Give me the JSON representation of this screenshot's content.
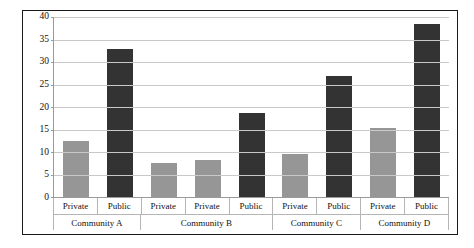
{
  "chart_data": {
    "type": "bar",
    "title": "",
    "xlabel": "",
    "ylabel": "",
    "ylim": [
      0,
      40
    ],
    "ytick_step": 5,
    "grid": true,
    "legend": "none",
    "ytick_labels": [
      "40",
      "35",
      "30",
      "25",
      "20",
      "15",
      "10",
      "5",
      "0"
    ],
    "categories": [
      "Private",
      "Public",
      "Private",
      "Private",
      "Public",
      "Private",
      "Public",
      "Private",
      "Public"
    ],
    "values": [
      12.4,
      32.8,
      7.5,
      8.2,
      18.6,
      9.5,
      26.9,
      15.3,
      38.4
    ],
    "bar_colors": [
      "#969696",
      "#333333",
      "#969696",
      "#969696",
      "#333333",
      "#969696",
      "#333333",
      "#969696",
      "#333333"
    ],
    "groups": [
      {
        "label": "Community A",
        "span": 2
      },
      {
        "label": "Community B",
        "span": 3
      },
      {
        "label": "Community C",
        "span": 2
      },
      {
        "label": "Community D",
        "span": 2
      }
    ],
    "colors": {
      "private_bar": "#969696",
      "public_bar": "#333333",
      "gridline": "#c9c9c9",
      "axis_line": "#9a9a9a",
      "frame_border": "#1a1a1a",
      "text": "#111111",
      "background": "#ffffff"
    }
  }
}
